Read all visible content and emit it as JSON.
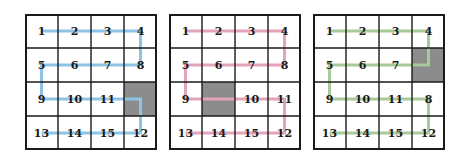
{
  "figure": {
    "grid_rows": 4,
    "grid_cols": 4,
    "obstacle_color": "#8c8c8c",
    "border_color": "#1a1a1a"
  },
  "panels": [
    {
      "id": "panel-1",
      "path_color": "#8ec3e6",
      "obstacle_cell": {
        "row": 2,
        "col": 3
      },
      "cells": [
        {
          "row": 0,
          "col": 0,
          "label": "1"
        },
        {
          "row": 0,
          "col": 1,
          "label": "2"
        },
        {
          "row": 0,
          "col": 2,
          "label": "3"
        },
        {
          "row": 0,
          "col": 3,
          "label": "4"
        },
        {
          "row": 1,
          "col": 0,
          "label": "5"
        },
        {
          "row": 1,
          "col": 1,
          "label": "6"
        },
        {
          "row": 1,
          "col": 2,
          "label": "7"
        },
        {
          "row": 1,
          "col": 3,
          "label": "8"
        },
        {
          "row": 2,
          "col": 0,
          "label": "9"
        },
        {
          "row": 2,
          "col": 1,
          "label": "10"
        },
        {
          "row": 2,
          "col": 2,
          "label": "11"
        },
        {
          "row": 3,
          "col": 0,
          "label": "13"
        },
        {
          "row": 3,
          "col": 1,
          "label": "14"
        },
        {
          "row": 3,
          "col": 2,
          "label": "15"
        },
        {
          "row": 3,
          "col": 3,
          "label": "12"
        }
      ],
      "path": [
        [
          0,
          0
        ],
        [
          0,
          3
        ],
        [
          1,
          3
        ],
        [
          1,
          0
        ],
        [
          2,
          0
        ],
        [
          2,
          3
        ],
        [
          3,
          3
        ],
        [
          3,
          0
        ]
      ]
    },
    {
      "id": "panel-2",
      "path_color": "#e3a3b8",
      "obstacle_cell": {
        "row": 2,
        "col": 1
      },
      "cells": [
        {
          "row": 0,
          "col": 0,
          "label": "1"
        },
        {
          "row": 0,
          "col": 1,
          "label": "2"
        },
        {
          "row": 0,
          "col": 2,
          "label": "3"
        },
        {
          "row": 0,
          "col": 3,
          "label": "4"
        },
        {
          "row": 1,
          "col": 0,
          "label": "5"
        },
        {
          "row": 1,
          "col": 1,
          "label": "6"
        },
        {
          "row": 1,
          "col": 2,
          "label": "7"
        },
        {
          "row": 1,
          "col": 3,
          "label": "8"
        },
        {
          "row": 2,
          "col": 0,
          "label": "9"
        },
        {
          "row": 2,
          "col": 2,
          "label": "10"
        },
        {
          "row": 2,
          "col": 3,
          "label": "11"
        },
        {
          "row": 3,
          "col": 0,
          "label": "13"
        },
        {
          "row": 3,
          "col": 1,
          "label": "14"
        },
        {
          "row": 3,
          "col": 2,
          "label": "15"
        },
        {
          "row": 3,
          "col": 3,
          "label": "12"
        }
      ],
      "path": [
        [
          0,
          0
        ],
        [
          0,
          3
        ],
        [
          1,
          3
        ],
        [
          1,
          0
        ],
        [
          2,
          0
        ],
        [
          2,
          3
        ],
        [
          3,
          3
        ],
        [
          3,
          0
        ]
      ]
    },
    {
      "id": "panel-3",
      "path_color": "#a9c99a",
      "obstacle_cell": {
        "row": 1,
        "col": 3
      },
      "cells": [
        {
          "row": 0,
          "col": 0,
          "label": "1"
        },
        {
          "row": 0,
          "col": 1,
          "label": "2"
        },
        {
          "row": 0,
          "col": 2,
          "label": "3"
        },
        {
          "row": 0,
          "col": 3,
          "label": "4"
        },
        {
          "row": 1,
          "col": 0,
          "label": "5"
        },
        {
          "row": 1,
          "col": 1,
          "label": "6"
        },
        {
          "row": 1,
          "col": 2,
          "label": "7"
        },
        {
          "row": 2,
          "col": 0,
          "label": "9"
        },
        {
          "row": 2,
          "col": 1,
          "label": "10"
        },
        {
          "row": 2,
          "col": 2,
          "label": "11"
        },
        {
          "row": 2,
          "col": 3,
          "label": "8"
        },
        {
          "row": 3,
          "col": 0,
          "label": "13"
        },
        {
          "row": 3,
          "col": 1,
          "label": "14"
        },
        {
          "row": 3,
          "col": 2,
          "label": "15"
        },
        {
          "row": 3,
          "col": 3,
          "label": "12"
        }
      ],
      "path": [
        [
          0,
          0
        ],
        [
          0,
          3
        ],
        [
          1,
          3
        ],
        [
          1,
          0
        ],
        [
          2,
          0
        ],
        [
          2,
          3
        ],
        [
          3,
          3
        ],
        [
          3,
          0
        ]
      ]
    }
  ]
}
